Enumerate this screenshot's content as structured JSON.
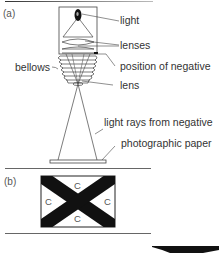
{
  "figure": {
    "panel_a": {
      "label": "(a)",
      "callouts": {
        "light": "light",
        "lenses": "lenses",
        "position_of_negative": "position of negative",
        "bellows": "bellows",
        "lens": "lens",
        "light_rays": "light rays from negative",
        "photographic_paper": "photographic paper"
      }
    },
    "panel_b": {
      "label": "(b)",
      "regions": [
        "C",
        "C",
        "C",
        "C"
      ]
    }
  },
  "colors": {
    "line": "#555555",
    "dark": "#111111",
    "divider": "#666666"
  }
}
